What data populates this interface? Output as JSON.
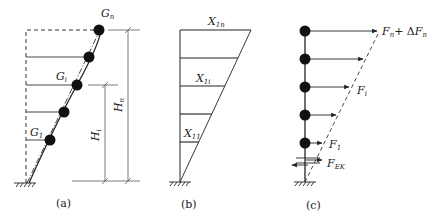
{
  "figure": {
    "panels": [
      {
        "id": "a",
        "caption": "(a)",
        "labels": {
          "top_mass": {
            "main": "G",
            "sub": "n"
          },
          "mid_mass": {
            "main": "G",
            "sub": "i"
          },
          "low_mass": {
            "main": "G",
            "sub": "1"
          },
          "height_i": {
            "main": "H",
            "sub": "i"
          },
          "height_n": {
            "main": "H",
            "sub": "n"
          }
        },
        "mass_count": 5
      },
      {
        "id": "b",
        "caption": "(b)",
        "labels": {
          "top": {
            "main": "X",
            "sub": "1n"
          },
          "mid": {
            "main": "X",
            "sub": "1i"
          },
          "low": {
            "main": "X",
            "sub": "11"
          }
        },
        "floor_count": 5
      },
      {
        "id": "c",
        "caption": "(c)",
        "labels": {
          "top_force": {
            "main": "F",
            "sub": "n",
            "plus": "+ Δ",
            "main2": "F",
            "sub2": "n"
          },
          "mid_force": {
            "main": "F",
            "sub": "i"
          },
          "low_force": {
            "main": "F",
            "sub": "1"
          },
          "base_shear": {
            "main": "F",
            "sub": "EK"
          }
        },
        "mass_count": 5
      }
    ]
  }
}
